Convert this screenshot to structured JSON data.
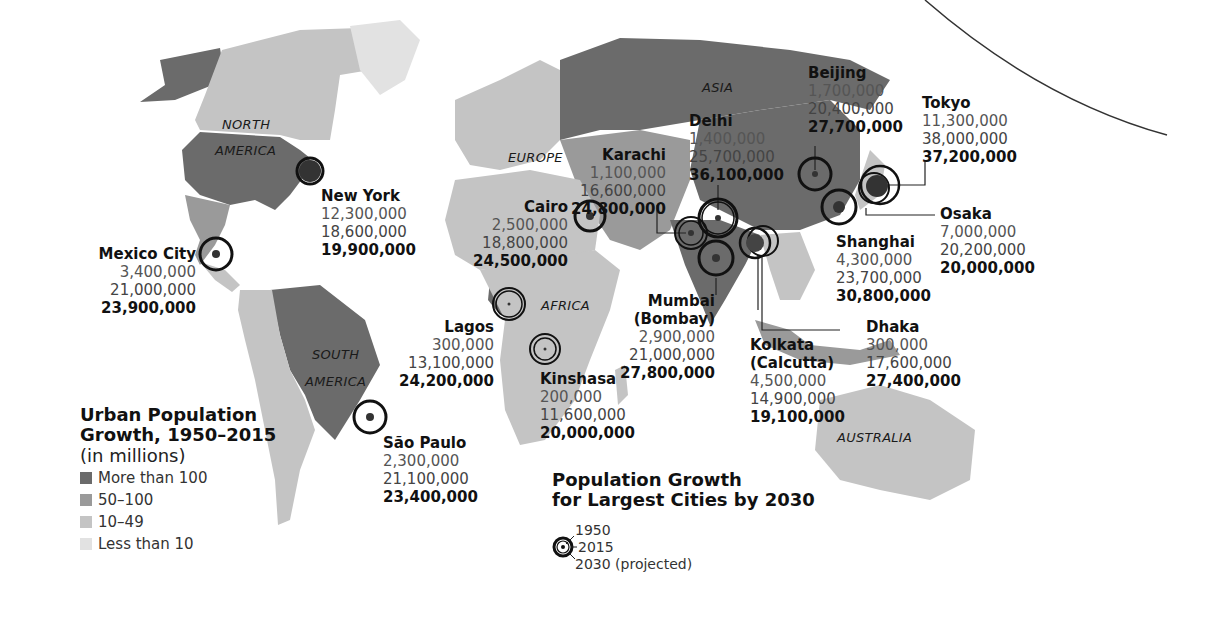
{
  "colors": {
    "more_than_100": "#6b6b6b",
    "50_100": "#9a9a9a",
    "10_49": "#c4c4c4",
    "less_than_10": "#e2e2e2",
    "ocean": "#ffffff",
    "ring": "#111111"
  },
  "continents": {
    "north_america": [
      "NORTH",
      "AMERICA"
    ],
    "south_america": [
      "SOUTH",
      "AMERICA"
    ],
    "europe": "EUROPE",
    "africa": "AFRICA",
    "asia": "ASIA",
    "australia": "AUSTRALIA"
  },
  "legend": {
    "title_line1": "Urban Population",
    "title_line2": "Growth, 1950–2015",
    "subtitle": "(in millions)",
    "items": [
      {
        "label": "More than 100",
        "color": "#6b6b6b"
      },
      {
        "label": "50–100",
        "color": "#9a9a9a"
      },
      {
        "label": "10–49",
        "color": "#c4c4c4"
      },
      {
        "label": "Less than 10",
        "color": "#e2e2e2"
      }
    ]
  },
  "ring_legend": {
    "title_line1": "Population Growth",
    "title_line2": "for Largest Cities by 2030",
    "ring_1950": "1950",
    "ring_2015": "2015",
    "ring_2030": "2030 (projected)"
  },
  "cities": {
    "new_york": {
      "name": "New York",
      "y1950": "12,300,000",
      "y2015": "18,600,000",
      "y2030": "19,900,000"
    },
    "mexico_city": {
      "name": "Mexico City",
      "y1950": "3,400,000",
      "y2015": "21,000,000",
      "y2030": "23,900,000"
    },
    "sao_paulo": {
      "name": "São Paulo",
      "y1950": "2,300,000",
      "y2015": "21,100,000",
      "y2030": "23,400,000"
    },
    "cairo": {
      "name": "Cairo",
      "y1950": "2,500,000",
      "y2015": "18,800,000",
      "y2030": "24,500,000"
    },
    "lagos": {
      "name": "Lagos",
      "y1950": "300,000",
      "y2015": "13,100,000",
      "y2030": "24,200,000"
    },
    "kinshasa": {
      "name": "Kinshasa",
      "y1950": "200,000",
      "y2015": "11,600,000",
      "y2030": "20,000,000"
    },
    "karachi": {
      "name": "Karachi",
      "y1950": "1,100,000",
      "y2015": "16,600,000",
      "y2030": "24,800,000"
    },
    "delhi": {
      "name": "Delhi",
      "y1950": "1,400,000",
      "y2015": "25,700,000",
      "y2030": "36,100,000"
    },
    "mumbai": {
      "name": "Mumbai",
      "name2": "(Bombay)",
      "y1950": "2,900,000",
      "y2015": "21,000,000",
      "y2030": "27,800,000"
    },
    "kolkata": {
      "name": "Kolkata",
      "name2": "(Calcutta)",
      "y1950": "4,500,000",
      "y2015": "14,900,000",
      "y2030": "19,100,000"
    },
    "dhaka": {
      "name": "Dhaka",
      "y1950": "300,000",
      "y2015": "17,600,000",
      "y2030": "27,400,000"
    },
    "beijing": {
      "name": "Beijing",
      "y1950": "1,700,000",
      "y2015": "20,400,000",
      "y2030": "27,700,000"
    },
    "shanghai": {
      "name": "Shanghai",
      "y1950": "4,300,000",
      "y2015": "23,700,000",
      "y2030": "30,800,000"
    },
    "tokyo": {
      "name": "Tokyo",
      "y1950": "11,300,000",
      "y2015": "38,000,000",
      "y2030": "37,200,000"
    },
    "osaka": {
      "name": "Osaka",
      "y1950": "7,000,000",
      "y2015": "20,200,000",
      "y2030": "20,000,000"
    }
  }
}
